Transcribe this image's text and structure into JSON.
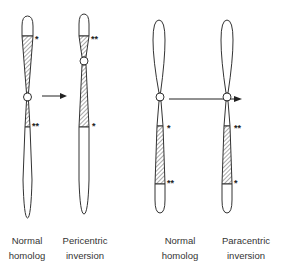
{
  "figure": {
    "type": "chromosome inversion diagram",
    "panels": [
      {
        "name": "pericentric",
        "left": {
          "label_line1": "Normal",
          "label_line2": "homolog",
          "upper_marker": "*",
          "lower_marker": "**"
        },
        "right": {
          "label_line1": "Pericentric",
          "label_line2": "inversion",
          "upper_marker": "**",
          "lower_marker": "*"
        }
      },
      {
        "name": "paracentric",
        "left": {
          "label_line1": "Normal",
          "label_line2": "homolog",
          "upper_marker": "*",
          "lower_marker": "**"
        },
        "right": {
          "label_line1": "Paracentric",
          "label_line2": "inversion",
          "upper_marker": "**",
          "lower_marker": "*"
        }
      }
    ],
    "colors": {
      "outline": "#333333",
      "hatch": "#555555",
      "background": "#ffffff"
    }
  }
}
